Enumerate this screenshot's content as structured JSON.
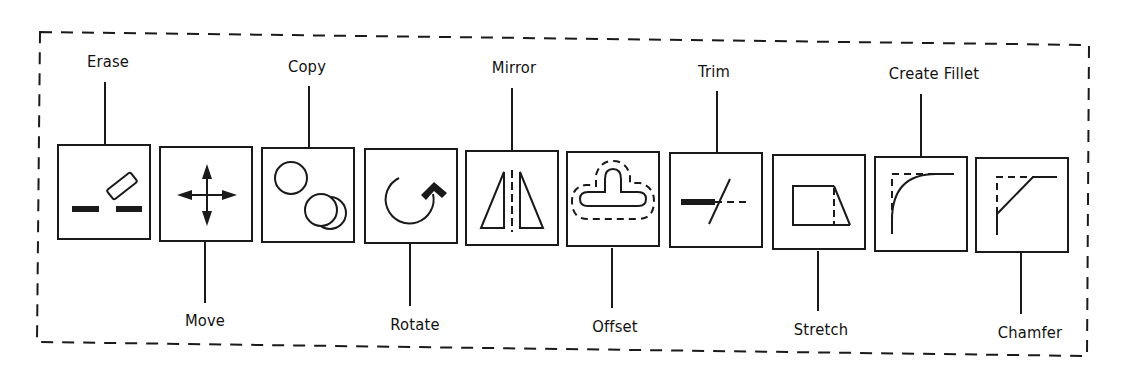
{
  "diagram": {
    "border_style": "dashed",
    "stroke_color": "#1a1a1a",
    "tools": [
      {
        "id": "erase",
        "label": "Erase",
        "label_position": "top",
        "icon": "erase-icon"
      },
      {
        "id": "move",
        "label": "Move",
        "label_position": "bottom",
        "icon": "move-arrows-icon"
      },
      {
        "id": "copy",
        "label": "Copy",
        "label_position": "top",
        "icon": "copy-circles-icon"
      },
      {
        "id": "rotate",
        "label": "Rotate",
        "label_position": "bottom",
        "icon": "rotate-arrow-icon"
      },
      {
        "id": "mirror",
        "label": "Mirror",
        "label_position": "top",
        "icon": "mirror-triangles-icon"
      },
      {
        "id": "offset",
        "label": "Offset",
        "label_position": "bottom",
        "icon": "offset-shape-icon"
      },
      {
        "id": "trim",
        "label": "Trim",
        "label_position": "top",
        "icon": "trim-line-icon"
      },
      {
        "id": "stretch",
        "label": "Stretch",
        "label_position": "bottom",
        "icon": "stretch-trapezoid-icon"
      },
      {
        "id": "fillet",
        "label": "Create Fillet",
        "label_position": "top",
        "icon": "fillet-corner-icon"
      },
      {
        "id": "chamfer",
        "label": "Chamfer",
        "label_position": "bottom",
        "icon": "chamfer-corner-icon"
      }
    ]
  }
}
